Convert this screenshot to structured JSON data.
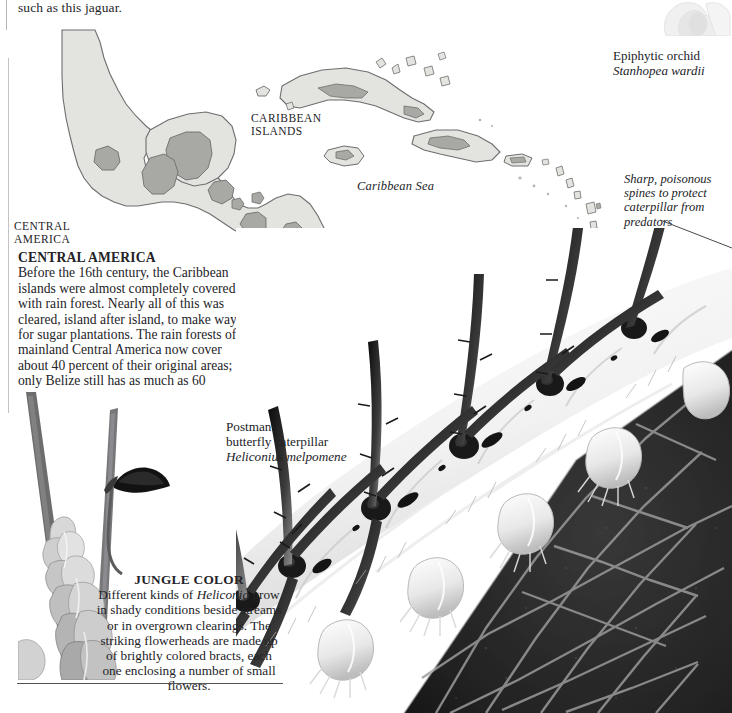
{
  "page": {
    "top_text": "such as this jaguar."
  },
  "map": {
    "labels": {
      "caribbean_islands": "CARIBBEAN\nISLANDS",
      "caribbean_islands_line1": "CARIBBEAN",
      "caribbean_islands_line2": "ISLANDS",
      "central_america_line1": "CENTRAL",
      "central_america_line2": "AMERICA",
      "caribbean_sea": "Caribbean Sea"
    },
    "legend": [
      {
        "label": "Former rain forest",
        "color": "#f2f2f0",
        "name": "former-rain-forest"
      },
      {
        "label": "Actual rain forest",
        "color": "#a8a8a4",
        "name": "actual-rain-forest"
      }
    ],
    "colors": {
      "former_rain_forest": "#e3e3e0",
      "actual_rain_forest": "#a8a8a4",
      "outline": "#6e6e6e",
      "sea": "#ffffff"
    }
  },
  "captions": {
    "central_america": {
      "heading": "CENTRAL AMERICA",
      "body": "Before the 16th century, the Caribbean islands were almost completely covered with rain forest. Nearly all of this was cleared, island after island, to make way for sugar plantations. The rain forests of mainland Central America now cover about 40 percent of their original areas; only Belize still has as much as 60 percent."
    },
    "jungle_color": {
      "heading": "JUNGLE COLOR",
      "body_part1": "Different kinds of ",
      "body_italic": "Heliconia",
      "body_part2": " grow in shady conditions beside streams or in overgrown clearings. The striking flowerheads are made up of brightly colored bracts, each one enclosing a number of small flowers."
    }
  },
  "labels": {
    "orchid": {
      "line1": "Epiphytic orchid",
      "line2": "Stanhopea wardii"
    },
    "spines": "Sharp, poisonous spines to protect caterpillar from predators",
    "caterpillar": {
      "line1": "Postman",
      "line2": "butterfly caterpillar",
      "line3": "Heliconius melpomene"
    }
  },
  "photos": {
    "orchid": "epiphytic-orchid-photo",
    "heliconia": "heliconia-plant-photo",
    "caterpillar": "postman-butterfly-caterpillar-photo"
  }
}
